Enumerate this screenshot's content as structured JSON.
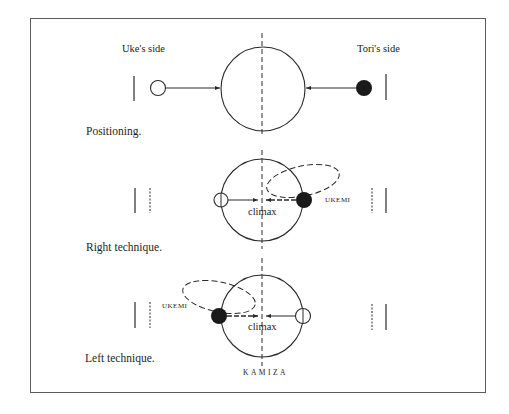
{
  "labels": {
    "uke_side": "Uke's side",
    "tori_side": "Tori's side",
    "kamiza": "KAMIZA"
  },
  "panels": [
    {
      "id": "positioning",
      "caption": "Positioning.",
      "center_label": ""
    },
    {
      "id": "right-technique",
      "caption": "Right technique.",
      "center_label": "climax",
      "ukemi_label": "UKEMI"
    },
    {
      "id": "left-technique",
      "caption": "Left technique.",
      "center_label": "climax",
      "ukemi_label": "UKEMI"
    }
  ],
  "colors": {
    "line": "#2a2a2a",
    "frame": "#5a5a5a",
    "tori_fill": "#1a1a1a",
    "uke_fill": "#ffffff"
  }
}
